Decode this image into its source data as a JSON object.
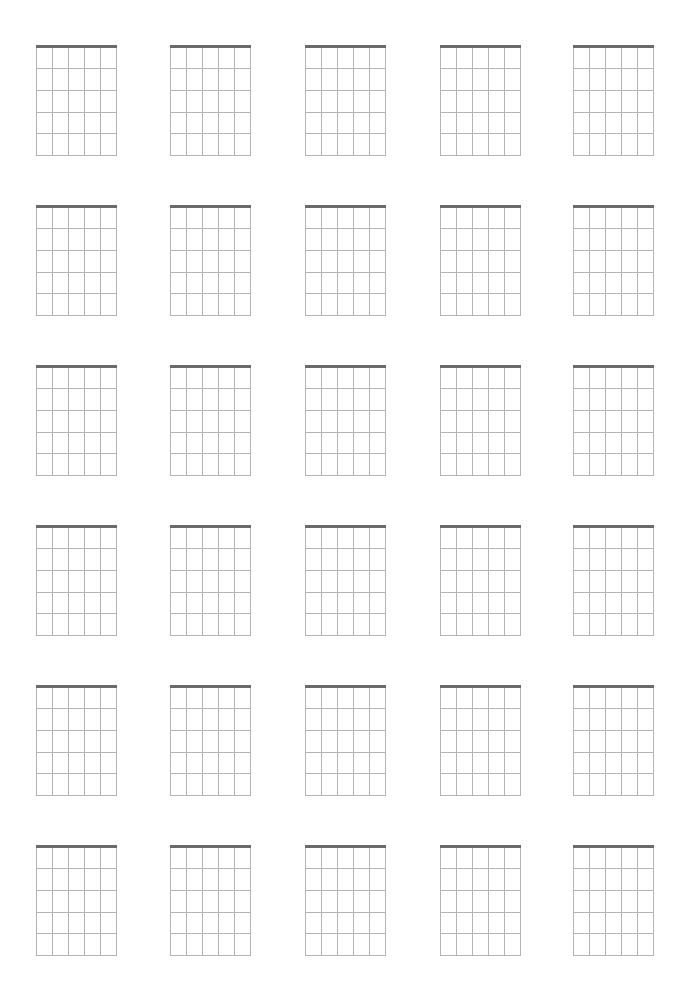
{
  "page": {
    "type": "blank guitar chord diagram sheet",
    "background": "#ffffff",
    "rows": 6,
    "columns": 5
  },
  "diagram": {
    "strings": 6,
    "frets": 5,
    "nut_color": "#6a6a6a",
    "grid_color": "#b4b4b4",
    "width_px": 81,
    "height_px": 109
  },
  "layout": {
    "column_x": [
      36,
      170,
      305,
      440,
      573
    ],
    "row_y": [
      47,
      207,
      367,
      527,
      687,
      847
    ]
  }
}
